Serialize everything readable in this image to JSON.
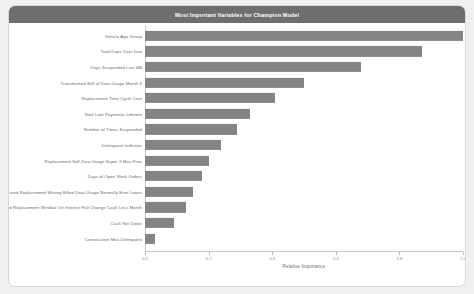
{
  "card": {
    "title": "Most Important Variables for Champion Model"
  },
  "chart_data": {
    "type": "bar",
    "orientation": "horizontal",
    "title": "Most Important Variables for Champion Model",
    "xlabel": "Relative Importance",
    "ylabel": "",
    "xlim": [
      0.0,
      1.0
    ],
    "xticks": [
      0.0,
      0.2,
      0.4,
      0.6,
      0.8,
      1.0
    ],
    "xtick_labels": [
      "0.0",
      "0.2",
      "0.4",
      "0.6",
      "0.8",
      "1.0"
    ],
    "grid": false,
    "legend": false,
    "bar_color": "#848484",
    "categories": [
      "Vehicle Age Group",
      "Total Days Over Due",
      "Days Suspended Last 6M",
      "Transformed Still of Data Usage Month 6",
      "Replacement Time Cycle Cost",
      "Total Late Payments Lifetime",
      "Number of Times Suspended",
      "Delinquent Indicator",
      "Replacement Still Zero Usage Super 3 Mos Prior",
      "Days of Open Work Orders",
      "Insured Replacement Writing Billed Data Usage Normally Ever Loans",
      "Imputed Replacement Window On Interest Full Change Cash Less Month",
      "Cash Net Down",
      "Consecutive Mos Delinquent"
    ],
    "values": [
      1.0,
      0.87,
      0.68,
      0.5,
      0.41,
      0.33,
      0.29,
      0.24,
      0.2,
      0.18,
      0.15,
      0.13,
      0.09,
      0.03
    ]
  }
}
